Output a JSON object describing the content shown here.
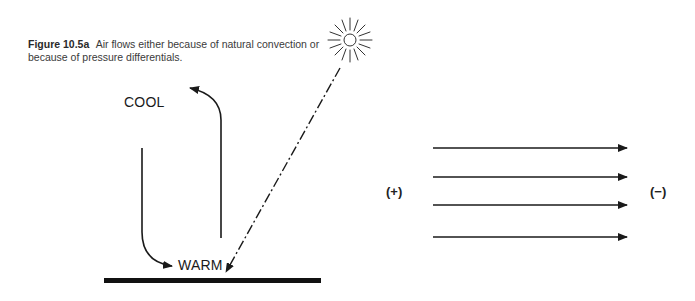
{
  "figure": {
    "number": "Figure 10.5a",
    "caption": "Air flows either because of natural convection or because of pressure differentials."
  },
  "convection": {
    "cool_label": "COOL",
    "warm_label": "WARM",
    "sun_icon": "sun-icon",
    "sunray": "dash-dot-line",
    "ground": "ground-bar"
  },
  "pressure": {
    "high_label": "(+)",
    "low_label": "(−)",
    "arrow_count": 4,
    "arrow_direction": "left-to-right"
  },
  "colors": {
    "ink": "#1a1a1a",
    "caption": "#3a3a3a"
  }
}
